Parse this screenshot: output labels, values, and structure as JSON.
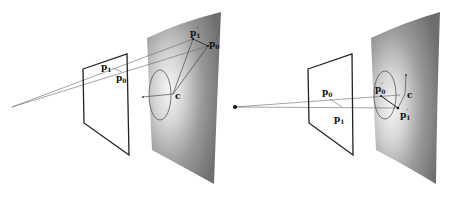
{
  "left_panel": {
    "labels": {
      "p1": "p",
      "p1_sub": "1",
      "p0": "p",
      "p0_sub": "0",
      "p1_prime": "p",
      "p1_prime_sub": "1",
      "p1_prime_mark": "′",
      "p0_prime": "p",
      "p0_prime_sub": "0",
      "p0_prime_mark": "′",
      "c": "c"
    }
  },
  "right_panel": {
    "labels": {
      "p0": "p",
      "p0_sub": "0",
      "p1": "p",
      "p1_sub": "1",
      "p0_prime": "p",
      "p0_prime_sub": "0",
      "p0_prime_mark": "′",
      "p1_prime": "p",
      "p1_prime_sub": "1",
      "p1_prime_mark": "′",
      "c": "c"
    }
  },
  "colors": {
    "frame": "#222222",
    "ray": "#555555",
    "surface_dark": "#6a6a6a",
    "surface_light": "#f4f4f4"
  }
}
